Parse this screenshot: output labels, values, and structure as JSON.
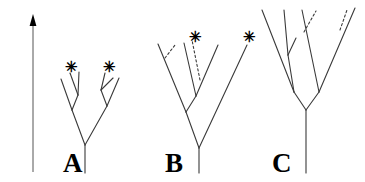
{
  "figure": {
    "background_color": "#ffffff",
    "line_color": "#3a3a3a",
    "text_color": "#000000",
    "width": 365,
    "height": 182
  },
  "axis": {
    "label": "Time",
    "direction": "upward",
    "arrow_icon": "arrow-up-icon",
    "line": {
      "x": 33,
      "y_top": 22,
      "y_bottom": 172
    },
    "arrow_head": {
      "x": 33,
      "y": 14
    }
  },
  "trees": [
    {
      "id": "A",
      "label": "A",
      "label_pos": {
        "x": 63,
        "y": 150
      },
      "stem": {
        "x1": 85,
        "y1": 173,
        "x2": 85,
        "y2": 145
      },
      "branches": [
        {
          "name": "root-left",
          "x1": 85,
          "y1": 145,
          "x2": 72,
          "y2": 110,
          "style": "solid"
        },
        {
          "name": "root-right",
          "x1": 85,
          "y1": 145,
          "x2": 107,
          "y2": 106,
          "style": "solid"
        },
        {
          "name": "left-node-left",
          "x1": 72,
          "y1": 110,
          "x2": 61,
          "y2": 79,
          "style": "solid"
        },
        {
          "name": "left-node-right",
          "x1": 72,
          "y1": 110,
          "x2": 78,
          "y2": 95,
          "style": "solid"
        },
        {
          "name": "left-sub-left",
          "x1": 78,
          "y1": 95,
          "x2": 70,
          "y2": 73,
          "style": "solid"
        },
        {
          "name": "left-sub-right",
          "x1": 78,
          "y1": 95,
          "x2": 79,
          "y2": 72,
          "style": "solid"
        },
        {
          "name": "right-node-left",
          "x1": 107,
          "y1": 106,
          "x2": 101,
          "y2": 90,
          "style": "solid"
        },
        {
          "name": "right-node-right",
          "x1": 107,
          "y1": 106,
          "x2": 119,
          "y2": 78,
          "style": "solid"
        },
        {
          "name": "right-sub-left",
          "x1": 101,
          "y1": 90,
          "x2": 105,
          "y2": 73,
          "style": "solid"
        },
        {
          "name": "right-sub-right",
          "x1": 101,
          "y1": 90,
          "x2": 113,
          "y2": 78,
          "style": "solid"
        }
      ],
      "markers": [
        {
          "symbol": "✳",
          "name": "extinction-marker",
          "x": 65,
          "y": 60
        },
        {
          "symbol": "✳",
          "name": "extinction-marker",
          "x": 103,
          "y": 60
        }
      ]
    },
    {
      "id": "B",
      "label": "B",
      "label_pos": {
        "x": 165,
        "y": 150
      },
      "stem": {
        "x1": 199,
        "y1": 173,
        "x2": 199,
        "y2": 148
      },
      "branches": [
        {
          "name": "root-left",
          "x1": 199,
          "y1": 148,
          "x2": 186,
          "y2": 112,
          "style": "solid"
        },
        {
          "name": "root-right",
          "x1": 199,
          "y1": 148,
          "x2": 247,
          "y2": 45,
          "style": "solid"
        },
        {
          "name": "left-node-left",
          "x1": 186,
          "y1": 112,
          "x2": 158,
          "y2": 44,
          "style": "solid"
        },
        {
          "name": "left-node-mid-stem",
          "x1": 186,
          "y1": 112,
          "x2": 196,
          "y2": 96,
          "style": "solid"
        },
        {
          "name": "left-trunk-up",
          "x1": 196,
          "y1": 96,
          "x2": 184,
          "y2": 43,
          "style": "solid"
        },
        {
          "name": "left-sub-right",
          "x1": 196,
          "y1": 96,
          "x2": 218,
          "y2": 45,
          "style": "solid"
        },
        {
          "name": "extinct-stub-left",
          "x1": 165,
          "y1": 58,
          "x2": 175,
          "y2": 45,
          "style": "dashed"
        },
        {
          "name": "extinct-branch-mid",
          "x1": 200,
          "y1": 80,
          "x2": 192,
          "y2": 40,
          "style": "dashed"
        }
      ],
      "markers": [
        {
          "symbol": "✳",
          "name": "extinction-marker",
          "x": 189,
          "y": 30
        },
        {
          "symbol": "✳",
          "name": "extinction-marker",
          "x": 243,
          "y": 30
        }
      ]
    },
    {
      "id": "C",
      "label": "C",
      "label_pos": {
        "x": 272,
        "y": 150
      },
      "stem": {
        "x1": 306,
        "y1": 173,
        "x2": 306,
        "y2": 110
      },
      "branches": [
        {
          "name": "root-left",
          "x1": 306,
          "y1": 110,
          "x2": 294,
          "y2": 92,
          "style": "solid"
        },
        {
          "name": "root-right",
          "x1": 306,
          "y1": 110,
          "x2": 319,
          "y2": 92,
          "style": "solid"
        },
        {
          "name": "left-node-left",
          "x1": 294,
          "y1": 92,
          "x2": 262,
          "y2": 10,
          "style": "solid"
        },
        {
          "name": "left-node-mid",
          "x1": 294,
          "y1": 92,
          "x2": 288,
          "y2": 55,
          "style": "solid"
        },
        {
          "name": "left-mid-up-left",
          "x1": 288,
          "y1": 55,
          "x2": 284,
          "y2": 10,
          "style": "solid"
        },
        {
          "name": "left-mid-up-right",
          "x1": 288,
          "y1": 55,
          "x2": 296,
          "y2": 38,
          "style": "solid"
        },
        {
          "name": "right-node-up",
          "x1": 319,
          "y1": 92,
          "x2": 302,
          "y2": 10,
          "style": "solid"
        },
        {
          "name": "right-node-right",
          "x1": 319,
          "y1": 92,
          "x2": 355,
          "y2": 8,
          "style": "solid"
        },
        {
          "name": "extinct-branch-left",
          "x1": 304,
          "y1": 32,
          "x2": 316,
          "y2": 11,
          "style": "dashed"
        },
        {
          "name": "extinct-branch-right",
          "x1": 340,
          "y1": 30,
          "x2": 347,
          "y2": 10,
          "style": "dashed"
        }
      ],
      "markers": []
    }
  ],
  "legend": {
    "asterisk_meaning": "extinction event marker",
    "dashed_meaning": "inferred or extinct lineage"
  }
}
